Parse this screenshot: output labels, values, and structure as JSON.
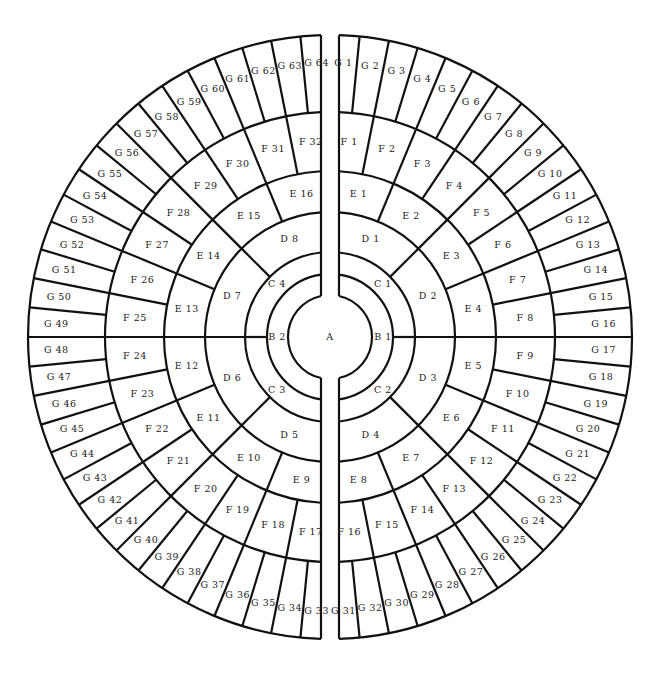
{
  "diagram": {
    "type": "concentric-ring-sector-diagram",
    "colors": {
      "line": "#111111",
      "background": "#ffffff",
      "text": "#222222"
    },
    "center_label": "A",
    "rings": [
      {
        "name": "B",
        "labels": [
          "B 1",
          "B 2"
        ]
      },
      {
        "name": "C",
        "labels": [
          "C 1",
          "C 2",
          "C 3",
          "C 4"
        ]
      },
      {
        "name": "D",
        "labels": [
          "D 1",
          "D 2",
          "D 3",
          "D 4",
          "D 5",
          "D 6",
          "D 7",
          "D 8"
        ]
      },
      {
        "name": "E",
        "labels": [
          "E 1",
          "E 2",
          "E 3",
          "E 4",
          "E 5",
          "E 6",
          "E 7",
          "E 8",
          "E 9",
          "E 10",
          "E 11",
          "E 12",
          "E 13",
          "E 14",
          "E 15",
          "E 16"
        ]
      },
      {
        "name": "F",
        "labels": [
          "F 1",
          "F 2",
          "F 3",
          "F 4",
          "F 5",
          "F 6",
          "F 7",
          "F 8",
          "F 9",
          "F 10",
          "F 11",
          "F 12",
          "F 13",
          "F 14",
          "F 15",
          "F 16",
          "F 17",
          "F 18",
          "F 19",
          "F 20",
          "F 21",
          "F 22",
          "F 23",
          "F 24",
          "F 25",
          "F 26",
          "F 27",
          "F 28",
          "F 29",
          "F 30",
          "F 31",
          "F 32"
        ]
      },
      {
        "name": "G",
        "labels": [
          "G 1",
          "G 2",
          "G 3",
          "G 4",
          "G 5",
          "G 6",
          "G 7",
          "G 8",
          "G 9",
          "G 10",
          "G 11",
          "G 12",
          "G 13",
          "G 14",
          "G 15",
          "G 16",
          "G 17",
          "G 18",
          "G 19",
          "G 20",
          "G 21",
          "G 22",
          "G 23",
          "G 24",
          "G 25",
          "G 26",
          "G 27",
          "G 28",
          "G 29",
          "G 30",
          "G 32",
          "G 31",
          "G 33",
          "G 34",
          "G 35",
          "G 36",
          "G 37",
          "G 38",
          "G 39",
          "G 40",
          "G 41",
          "G 42",
          "G 43",
          "G 44",
          "G 45",
          "G 46",
          "G 47",
          "G 48",
          "G 49",
          "G 50",
          "G 51",
          "G 52",
          "G 53",
          "G 54",
          "G 55",
          "G 56",
          "G 57",
          "G 58",
          "G 59",
          "G 60",
          "G 61",
          "G 62",
          "G 63",
          "G 64"
        ]
      }
    ]
  }
}
